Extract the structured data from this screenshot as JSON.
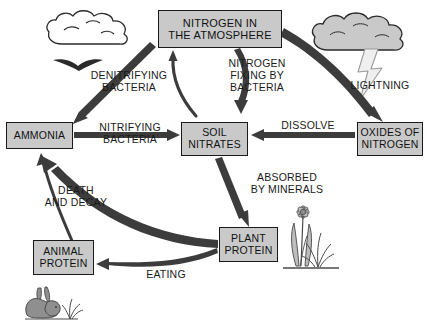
{
  "diagram": {
    "width": 429,
    "height": 326,
    "background": "#ffffff",
    "colors": {
      "box_fill": "#c9c9c9",
      "box_border": "#1a1a1a",
      "arrow": "#3c3c3c",
      "text": "#1a1a1a",
      "cloud_gray_fill": "#c9c9c9",
      "cloud_white_fill": "#ffffff",
      "rabbit_fill": "#8f8f8f",
      "plant_fill": "#b3b3b3",
      "lightning_fill": "#ececec"
    }
  },
  "nodes": [
    {
      "id": "atmosphere",
      "lines": [
        "NITROGEN  IN",
        "THE ATMOSPHERE"
      ]
    },
    {
      "id": "ammonia",
      "lines": [
        "AMMONIA"
      ]
    },
    {
      "id": "soil_nitrates",
      "lines": [
        "SOIL",
        "NITRATES"
      ]
    },
    {
      "id": "oxides",
      "lines": [
        "OXIDES OF",
        "NITROGEN"
      ]
    },
    {
      "id": "plant_protein",
      "lines": [
        "PLANT",
        "PROTEIN"
      ]
    },
    {
      "id": "animal_protein",
      "lines": [
        "ANIMAL",
        "PROTEIN"
      ]
    }
  ],
  "labels": [
    {
      "id": "denitrifying",
      "lines": [
        "DENITRIFYING",
        "BACTERIA"
      ]
    },
    {
      "id": "nitrogen_fixing",
      "lines": [
        "NITROGEN",
        "FIXING BY",
        "BACTERIA"
      ]
    },
    {
      "id": "lightning",
      "lines": [
        "LIGHTNING"
      ]
    },
    {
      "id": "nitrifying",
      "lines": [
        "NITRIFYING",
        "BACTERIA"
      ]
    },
    {
      "id": "dissolve",
      "lines": [
        "DISSOLVE"
      ]
    },
    {
      "id": "absorbed",
      "lines": [
        "ABSORBED",
        "BY MINERALS"
      ]
    },
    {
      "id": "death_decay",
      "lines": [
        "DEATH",
        "AND DECAY"
      ]
    },
    {
      "id": "eating",
      "lines": [
        "EATING"
      ]
    }
  ],
  "node_text": {
    "atmosphere_line1": "NITROGEN  IN",
    "atmosphere_line2": "THE ATMOSPHERE",
    "ammonia_line1": "AMMONIA",
    "soil_nitrates_line1": "SOIL",
    "soil_nitrates_line2": "NITRATES",
    "oxides_line1": "OXIDES OF",
    "oxides_line2": "NITROGEN",
    "plant_protein_line1": "PLANT",
    "plant_protein_line2": "PROTEIN",
    "animal_protein_line1": "ANIMAL",
    "animal_protein_line2": "PROTEIN"
  },
  "label_text": {
    "denitrifying_line1": "DENITRIFYING",
    "denitrifying_line2": "BACTERIA",
    "nitrogen_fixing_line1": "NITROGEN",
    "nitrogen_fixing_line2": "FIXING BY",
    "nitrogen_fixing_line3": "BACTERIA",
    "lightning_line1": "LIGHTNING",
    "nitrifying_line1": "NITRIFYING",
    "nitrifying_line2": "BACTERIA",
    "dissolve_line1": "DISSOLVE",
    "absorbed_line1": "ABSORBED",
    "absorbed_line2": "BY MINERALS",
    "death_decay_line1": "DEATH",
    "death_decay_line2": "AND DECAY",
    "eating_line1": "EATING"
  },
  "illustrations": [
    {
      "id": "white_cloud",
      "name": "cloud-outline-illustration"
    },
    {
      "id": "bird",
      "name": "bird-illustration"
    },
    {
      "id": "gray_cloud",
      "name": "storm-cloud-illustration"
    },
    {
      "id": "lightning_bolt",
      "name": "lightning-bolt-illustration"
    },
    {
      "id": "flower_grass",
      "name": "flower-and-grass-illustration"
    },
    {
      "id": "rabbit",
      "name": "rabbit-illustration"
    }
  ],
  "flows": [
    {
      "from": "ammonia",
      "to": "atmosphere",
      "label": "DENITRIFYING BACTERIA"
    },
    {
      "from": "soil_nitrates",
      "to": "atmosphere",
      "label": "DENITRIFYING BACTERIA"
    },
    {
      "from": "atmosphere",
      "to": "soil_nitrates",
      "label": "NITROGEN FIXING BY BACTERIA"
    },
    {
      "from": "atmosphere",
      "to": "oxides",
      "label": "LIGHTNING"
    },
    {
      "from": "ammonia",
      "to": "soil_nitrates",
      "label": "NITRIFYING BACTERIA"
    },
    {
      "from": "oxides",
      "to": "soil_nitrates",
      "label": "DISSOLVE"
    },
    {
      "from": "soil_nitrates",
      "to": "plant_protein",
      "label": "ABSORBED BY MINERALS"
    },
    {
      "from": "plant_protein",
      "to": "ammonia",
      "label": "DEATH AND DECAY"
    },
    {
      "from": "animal_protein",
      "to": "ammonia",
      "label": "DEATH AND DECAY"
    },
    {
      "from": "plant_protein",
      "to": "animal_protein",
      "label": "EATING"
    }
  ]
}
